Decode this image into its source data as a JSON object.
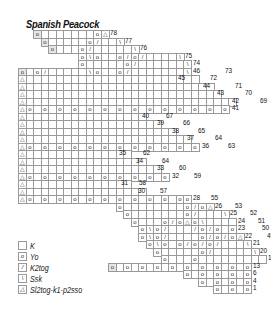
{
  "title": "Spanish Peacock",
  "cell_size": 7.5,
  "origin": {
    "x": 18,
    "y": 30
  },
  "symbols": {
    "K": "",
    "o": "o",
    "/": "/",
    "\\": "\\",
    "A": "△"
  },
  "rows": [
    {
      "r": 0,
      "start": 2,
      "cells": "o.......oA",
      "gray": [
        2
      ],
      "labels": [
        {
          "t": "78",
          "dx": 0
        }
      ]
    },
    {
      "r": 1,
      "start": 3,
      "cells": "o.....o/..\\",
      "gray": [
        3
      ],
      "labels": [
        {
          "t": "77",
          "dx": 0
        }
      ]
    },
    {
      "r": 2,
      "start": 4,
      "cells": "o...o/.....\\",
      "gray": [
        4
      ],
      "labels": [
        {
          "t": "76",
          "dx": 0
        }
      ]
    },
    {
      "r": 3,
      "start": 8,
      "cells": "o\\o..o/o/....\\",
      "labels": [
        {
          "t": "75",
          "dx": 0
        }
      ]
    },
    {
      "r": 4,
      "start": 8,
      "cells": "o.....o/......\\",
      "labels": [
        {
          "t": "74",
          "dx": 0
        }
      ]
    },
    {
      "r": 5,
      "start": 0,
      "cells": "o.o/.....\\o..o/.......\\",
      "gray": [
        0
      ],
      "labels": [
        {
          "t": "46",
          "dx": 0
        },
        {
          "t": "73",
          "dx": 32
        }
      ]
    },
    {
      "r": 6,
      "start": 0,
      "cells": "A.......................",
      "labels": [
        {
          "t": "45",
          "dx": -22
        },
        {
          "t": "72",
          "dx": 10
        }
      ]
    },
    {
      "r": 7,
      "start": 0,
      "cells": "A.........................",
      "labels": [
        {
          "t": "44",
          "dx": -12
        },
        {
          "t": "71",
          "dx": 20
        }
      ]
    },
    {
      "r": 8,
      "start": 0,
      "cells": "A..........................",
      "labels": [
        {
          "t": "43",
          "dx": -6
        },
        {
          "t": "70",
          "dx": 22
        }
      ]
    },
    {
      "r": 9,
      "start": 0,
      "cells": "A............................",
      "labels": [
        {
          "t": "42",
          "dx": -6
        },
        {
          "t": "69",
          "dx": 22
        }
      ]
    },
    {
      "r": 10,
      "start": 0,
      "cells": "Ao.o.o.o.o.o.o.o.o.o.o.o.o.o",
      "labels": [
        {
          "t": "41",
          "dx": 2
        },
        {
          "t": "68",
          "dx": 46
        }
      ]
    },
    {
      "r": 11,
      "start": 0,
      "cells": "A................",
      "labels": [
        {
          "t": "40",
          "dx": -6
        },
        {
          "t": "67",
          "dx": 18
        }
      ]
    },
    {
      "r": 12,
      "start": 0,
      "cells": "A..................",
      "labels": [
        {
          "t": "39",
          "dx": -6
        },
        {
          "t": "66",
          "dx": 20
        }
      ]
    },
    {
      "r": 13,
      "start": 0,
      "cells": "A....................",
      "labels": [
        {
          "t": "38",
          "dx": -6
        },
        {
          "t": "65",
          "dx": 20
        }
      ]
    },
    {
      "r": 14,
      "start": 0,
      "cells": "A......................",
      "labels": [
        {
          "t": "37",
          "dx": -6
        },
        {
          "t": "64",
          "dx": 22
        }
      ]
    },
    {
      "r": 15,
      "start": 0,
      "cells": "Ao.o.o.o.o.o.o.o.o.o.o.o",
      "labels": [
        {
          "t": "36",
          "dx": 2
        },
        {
          "t": "63",
          "dx": 28
        }
      ]
    },
    {
      "r": 16,
      "start": 0,
      "cells": "A..............",
      "labels": [
        {
          "t": "35",
          "dx": -14
        },
        {
          "t": "62",
          "dx": 10
        }
      ]
    },
    {
      "r": 17,
      "start": 0,
      "cells": "A................",
      "labels": [
        {
          "t": "34",
          "dx": -12
        },
        {
          "t": "64",
          "dx": 14
        }
      ]
    },
    {
      "r": 18,
      "start": 0,
      "cells": "A..................",
      "labels": [
        {
          "t": "33",
          "dx": -6
        },
        {
          "t": "60",
          "dx": 16
        }
      ]
    },
    {
      "r": 19,
      "start": 0,
      "cells": "Ao.o.o.o.o.o.o.o.o.o",
      "labels": [
        {
          "t": "32",
          "dx": 2
        },
        {
          "t": "59",
          "dx": 24
        }
      ]
    },
    {
      "r": 20,
      "start": 0,
      "cells": "A..............",
      "labels": [
        {
          "t": "31",
          "dx": -12
        },
        {
          "t": "58",
          "dx": 6
        }
      ]
    },
    {
      "r": 21,
      "start": 0,
      "cells": "A................",
      "labels": [
        {
          "t": "30",
          "dx": -10
        },
        {
          "t": "57",
          "dx": 12
        }
      ]
    },
    {
      "r": 22,
      "start": 0,
      "cells": "Ao.o.o.o.o.o.o.o.o.o.oo",
      "labels": [
        {
          "t": "28",
          "dx": 0
        },
        {
          "t": "55",
          "dx": 18
        }
      ]
    },
    {
      "r": 23,
      "start": 13,
      "cells": "o........o/oA",
      "labels": [
        {
          "t": "26",
          "dx": 0
        },
        {
          "t": "53",
          "dx": 20
        }
      ]
    },
    {
      "r": 24,
      "start": 14,
      "cells": "o.......o/...\\",
      "labels": [
        {
          "t": "25",
          "dx": 0
        },
        {
          "t": "52",
          "dx": 20
        }
      ]
    },
    {
      "r": 25,
      "start": 15,
      "cells": "o...o/oAo\\....",
      "labels": [
        {
          "t": "24",
          "dx": 0
        },
        {
          "t": "51",
          "dx": 20
        }
      ]
    },
    {
      "r": 26,
      "start": 16,
      "cells": "o\\o/.../o/o.o",
      "labels": [
        {
          "t": "23",
          "dx": 0
        },
        {
          "t": "50",
          "dx": 24
        }
      ]
    },
    {
      "r": 27,
      "start": 16,
      "cells": "o\\o/....o/o/oA",
      "labels": [
        {
          "t": "22",
          "dx": 0
        },
        {
          "t": "49",
          "dx": 22
        }
      ]
    },
    {
      "r": 28,
      "start": 17,
      "cells": "o\\o.o/o/o/...\\",
      "labels": [
        {
          "t": "21",
          "dx": 0
        },
        {
          "t": "48",
          "dx": 22
        }
      ]
    },
    {
      "r": 29,
      "start": 18,
      "cells": "o.....o/.....\\",
      "labels": [
        {
          "t": "20",
          "dx": 0
        },
        {
          "t": "47",
          "dx": 22
        }
      ]
    },
    {
      "r": 30,
      "start": 19,
      "cells": "o...o.........",
      "labels": [
        {
          "t": "19",
          "dx": 0
        }
      ]
    },
    {
      "r": 31,
      "start": 12,
      "cells": "o.o.o.o.o.o.o.o.o.o",
      "gray": [
        12
      ],
      "labels": [
        {
          "t": "13",
          "dx": 0
        }
      ]
    },
    {
      "r": 32,
      "start": 22,
      "cells": "o.o.o.o.o",
      "labels": [
        {
          "t": "6",
          "dx": 0
        }
      ]
    },
    {
      "r": 33,
      "start": 24,
      "cells": "o.o.o.o",
      "labels": [
        {
          "t": "4",
          "dx": 0
        }
      ]
    },
    {
      "r": 34,
      "start": 26,
      "cells": "o.o.o",
      "labels": [
        {
          "t": "1",
          "dx": 0
        }
      ]
    }
  ],
  "legend": [
    {
      "symbol": "",
      "label": "K"
    },
    {
      "symbol": "o",
      "label": "Yo"
    },
    {
      "symbol": "/",
      "label": "K2tog"
    },
    {
      "symbol": "\\",
      "label": "Ssk"
    },
    {
      "symbol": "△",
      "label": "Sl2tog-k1-p2sso"
    }
  ]
}
